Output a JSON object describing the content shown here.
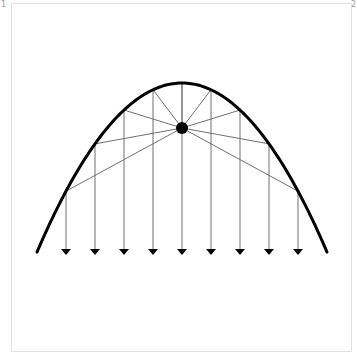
{
  "labels": {
    "corner_left": "1",
    "corner_right": "2"
  },
  "diagram": {
    "title": "",
    "parabola": {
      "vertex": [
        182,
        83
      ],
      "k": 0.00804,
      "x_start": 37,
      "x_end": 327,
      "stroke": "#000000",
      "stroke_width": 3
    },
    "focus": {
      "cx": 182,
      "cy": 128,
      "r": 6,
      "fill": "#000000"
    },
    "rays_x": [
      66,
      95,
      124,
      153,
      182,
      211,
      240,
      269,
      298
    ],
    "ray_end_y": 253,
    "ray_color": "#707070",
    "arrow_color": "#000000"
  }
}
